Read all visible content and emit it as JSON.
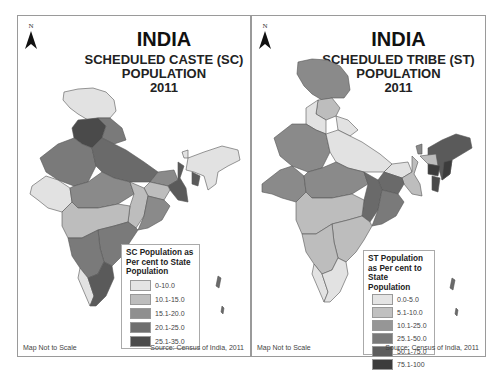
{
  "panels": [
    {
      "id": "sc",
      "north_label": "N",
      "title": "INDIA",
      "subtitle_line1": "SCHEDULED CASTE (SC)",
      "subtitle_line2": "POPULATION",
      "year": "2011",
      "legend": {
        "title": "SC Population as Per cent to State Population",
        "items": [
          {
            "label": "0-10.0",
            "color": "#e4e4e4"
          },
          {
            "label": "10.1-15.0",
            "color": "#bdbdbd"
          },
          {
            "label": "15.1-20.0",
            "color": "#8f8f8f"
          },
          {
            "label": "20.1-25.0",
            "color": "#6e6e6e"
          },
          {
            "label": "25.1-35.0",
            "color": "#4b4b4b"
          }
        ]
      },
      "footer_left": "Map Not to Scale",
      "footer_right": "Source: Census of India, 2011"
    },
    {
      "id": "st",
      "north_label": "N",
      "title": "INDIA",
      "subtitle_line1": "SCHEDULED TRIBE (ST)",
      "subtitle_line2": "POPULATION",
      "year": "2011",
      "legend": {
        "title": "ST Population as Per cent to State Population",
        "items": [
          {
            "label": "0.0-5.0",
            "color": "#e4e4e4"
          },
          {
            "label": "5.1-10.0",
            "color": "#c0c0c0"
          },
          {
            "label": "10.1-25.0",
            "color": "#969696"
          },
          {
            "label": "25.1-50.0",
            "color": "#7a7a7a"
          },
          {
            "label": "50.1-75.0",
            "color": "#5e5e5e"
          },
          {
            "label": "75.1-100",
            "color": "#3c3c3c"
          }
        ]
      },
      "footer_left": "Map Not to Scale",
      "footer_right": "Source: Census of India, 2011"
    }
  ]
}
